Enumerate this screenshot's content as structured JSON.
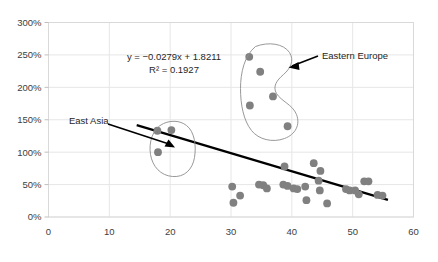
{
  "chart_data": {
    "type": "scatter",
    "title": "",
    "xlabel": "",
    "ylabel": "",
    "xlim": [
      0,
      60
    ],
    "ylim": [
      0,
      3.0
    ],
    "x_ticks": [
      "0",
      "10",
      "20",
      "30",
      "40",
      "50",
      "60"
    ],
    "x_tick_values": [
      0,
      10,
      20,
      30,
      40,
      50,
      60
    ],
    "y_ticks": [
      "0%",
      "50%",
      "100%",
      "150%",
      "200%",
      "250%",
      "300%"
    ],
    "y_tick_values": [
      0,
      0.5,
      1.0,
      1.5,
      2.0,
      2.5,
      3.0
    ],
    "grid": true,
    "legend": "none",
    "marker_color": "#808080",
    "marker_size": 5,
    "trendline": {
      "equation_label": "y = −0.0279x + 1.8211",
      "r2_label": "R² = 0.1927",
      "slope": -0.0279,
      "intercept": 1.8211,
      "r_squared": 0.1927,
      "color": "#000000",
      "x_start": 14.5,
      "x_end": 55.8
    },
    "points": [
      {
        "x": 17.9,
        "y": 1.33
      },
      {
        "x": 20.2,
        "y": 1.34
      },
      {
        "x": 18.0,
        "y": 1.0
      },
      {
        "x": 33.0,
        "y": 2.47
      },
      {
        "x": 34.8,
        "y": 2.24
      },
      {
        "x": 36.9,
        "y": 1.86
      },
      {
        "x": 33.1,
        "y": 1.72
      },
      {
        "x": 39.3,
        "y": 1.4
      },
      {
        "x": 30.2,
        "y": 0.47
      },
      {
        "x": 30.4,
        "y": 0.22
      },
      {
        "x": 31.5,
        "y": 0.33
      },
      {
        "x": 34.6,
        "y": 0.5
      },
      {
        "x": 35.3,
        "y": 0.49
      },
      {
        "x": 35.9,
        "y": 0.44
      },
      {
        "x": 38.8,
        "y": 0.78
      },
      {
        "x": 38.6,
        "y": 0.5
      },
      {
        "x": 39.3,
        "y": 0.48
      },
      {
        "x": 40.3,
        "y": 0.44
      },
      {
        "x": 40.9,
        "y": 0.43
      },
      {
        "x": 42.2,
        "y": 0.47
      },
      {
        "x": 42.4,
        "y": 0.26
      },
      {
        "x": 43.6,
        "y": 0.83
      },
      {
        "x": 44.4,
        "y": 0.56
      },
      {
        "x": 44.7,
        "y": 0.71
      },
      {
        "x": 44.6,
        "y": 0.41
      },
      {
        "x": 45.8,
        "y": 0.21
      },
      {
        "x": 48.9,
        "y": 0.43
      },
      {
        "x": 49.5,
        "y": 0.41
      },
      {
        "x": 50.4,
        "y": 0.41
      },
      {
        "x": 51.0,
        "y": 0.35
      },
      {
        "x": 51.9,
        "y": 0.55
      },
      {
        "x": 52.6,
        "y": 0.55
      },
      {
        "x": 54.1,
        "y": 0.34
      },
      {
        "x": 54.9,
        "y": 0.33
      }
    ],
    "annotations": [
      {
        "id": "east-asia",
        "label": "East Asia",
        "shape": "ellipse",
        "target_x": 18.5,
        "target_y": 1.2
      },
      {
        "id": "eastern-europe",
        "label": "Eastern Europe",
        "shape": "lasso",
        "target_x": 37.0,
        "target_y": 2.0
      }
    ]
  }
}
